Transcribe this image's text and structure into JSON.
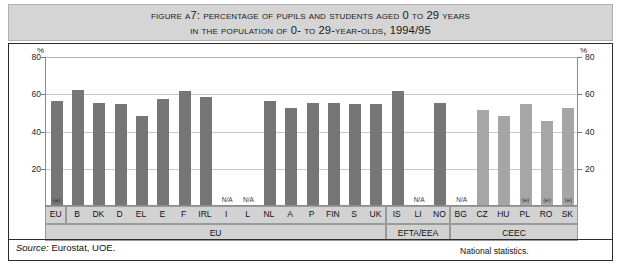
{
  "title": {
    "line1": "Figure A7: Percentage of pupils and students aged 0 to 29 years",
    "line2": "in the population of 0- to 29-year-olds, 1994/95"
  },
  "axis": {
    "unit_left": "%",
    "unit_right": "%",
    "ticks": [
      "80",
      "60",
      "40",
      "20"
    ],
    "ticks_right": [
      "80",
      "60",
      "40",
      "20"
    ]
  },
  "groups": [
    {
      "label": "EU"
    },
    {
      "label": "EFTA/EEA"
    },
    {
      "label": "CEEC"
    },
    {
      "label": "National statistics."
    }
  ],
  "source": {
    "prefix": "Source:",
    "text": "Eurostat, UOE."
  },
  "notes": {
    "na": "N/A",
    "estimate": "(e)"
  },
  "chart_data": {
    "type": "bar",
    "title": "Percentage of pupils and students aged 0 to 29 years in the population of 0- to 29-year-olds, 1994/95",
    "xlabel": "",
    "ylabel": "%",
    "ylim": [
      0,
      80
    ],
    "yticks": [
      0,
      20,
      40,
      60,
      80
    ],
    "grid": true,
    "legend": "none",
    "categories": [
      "EU",
      "B",
      "DK",
      "D",
      "EL",
      "E",
      "F",
      "IRL",
      "I",
      "L",
      "NL",
      "A",
      "P",
      "FIN",
      "S",
      "UK",
      "IS",
      "LI",
      "NO",
      "BG",
      "CZ",
      "HU",
      "PL",
      "RO",
      "SK"
    ],
    "values": [
      56,
      62,
      55,
      54,
      48,
      57,
      61,
      58,
      null,
      null,
      56,
      52,
      55,
      55,
      54,
      54,
      61,
      null,
      55,
      null,
      51,
      48,
      54,
      45,
      52
    ],
    "group_of": [
      "EU",
      "EU",
      "EU",
      "EU",
      "EU",
      "EU",
      "EU",
      "EU",
      "EU",
      "EU",
      "EU",
      "EU",
      "EU",
      "EU",
      "EU",
      "EU",
      "EFTA/EEA",
      "EFTA/EEA",
      "EFTA/EEA",
      "CEEC",
      "CEEC",
      "CEEC",
      "CEEC",
      "CEEC",
      "CEEC"
    ],
    "annotations": [
      {
        "category": "EU",
        "text": "(e)"
      },
      {
        "category": "I",
        "text": "N/A"
      },
      {
        "category": "L",
        "text": "N/A"
      },
      {
        "category": "LI",
        "text": "N/A"
      },
      {
        "category": "BG",
        "text": "N/A"
      },
      {
        "category": "PL",
        "text": "(e)"
      },
      {
        "category": "RO",
        "text": "(e)"
      },
      {
        "category": "SK",
        "text": "(e)"
      }
    ],
    "colors": {
      "eu_bar": "#767676",
      "ceec_bar": "#a6a6a6",
      "grid": "#c9c9c9",
      "title_band": "#d5d5d5"
    }
  }
}
